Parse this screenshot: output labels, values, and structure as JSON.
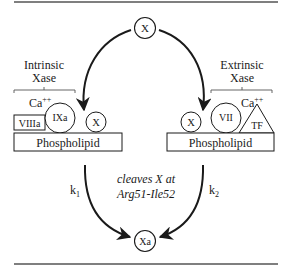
{
  "diagram": {
    "title": "",
    "top_node": {
      "label": "X"
    },
    "product_node": {
      "label": "Xa"
    },
    "intrinsic": {
      "title_line1": "Intrinsic",
      "title_line2": "Xase",
      "cofactor_ion": "Ca",
      "ion_charge": "++",
      "cofactor": "VIIIa",
      "enzyme": "IXa",
      "substrate": "X",
      "membrane": "Phospholipid",
      "rate_constant": "k",
      "rate_subscript": "1"
    },
    "extrinsic": {
      "title_line1": "Extrinsic",
      "title_line2": "Xase",
      "cofactor_ion": "Ca",
      "ion_charge": "++",
      "substrate": "X",
      "enzyme": "VII",
      "cofactor": "TF",
      "membrane": "Phospholipid",
      "rate_constant": "k",
      "rate_subscript": "2"
    },
    "cleavage_note": {
      "line1": "cleaves X at",
      "line2": "Arg51-Ile52"
    },
    "colors": {
      "ink": "#1a1a1a",
      "rule": "#555555",
      "background": "#ffffff"
    }
  }
}
